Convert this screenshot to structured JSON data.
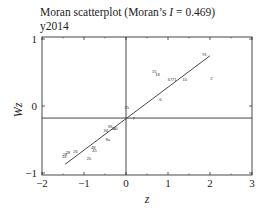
{
  "chart_data": {
    "type": "scatter",
    "title": "Moran scatterplot (Moran’s I = 0.469)",
    "title_parts": {
      "prefix": "Moran scatterplot (Moran’s ",
      "italic": "I",
      "suffix": " = 0.469)"
    },
    "subtitle": "y2014",
    "xlabel": "z",
    "ylabel": "Wz",
    "xlim": [
      -2,
      3
    ],
    "ylim": [
      -1,
      1
    ],
    "xticks": [
      "-2",
      "-1",
      "0",
      "1",
      "2",
      "3"
    ],
    "yticks": [
      "1",
      "0",
      "-1"
    ],
    "grid": false,
    "legend": null,
    "reference_lines": {
      "vertical_x": 0.0,
      "horizontal_y": -0.18
    },
    "regression_line": {
      "slope": 0.469,
      "from": [
        -1.45,
        -0.87
      ],
      "to": [
        2.0,
        0.75
      ]
    },
    "points": [
      {
        "label": "91",
        "x": 1.87,
        "y": 0.77
      },
      {
        "label": "15",
        "x": 0.67,
        "y": 0.52
      },
      {
        "label": "18",
        "x": 0.75,
        "y": 0.47
      },
      {
        "label": "2",
        "x": 2.03,
        "y": 0.41
      },
      {
        "label": "67",
        "x": 1.05,
        "y": 0.39
      },
      {
        "label": "71",
        "x": 1.15,
        "y": 0.4
      },
      {
        "label": "10",
        "x": 1.4,
        "y": 0.4
      },
      {
        "label": "6",
        "x": 0.82,
        "y": 0.09
      },
      {
        "label": "55",
        "x": 0.02,
        "y": -0.02
      },
      {
        "label": "7",
        "x": 0.18,
        "y": -0.18
      },
      {
        "label": "39",
        "x": -0.38,
        "y": -0.31
      },
      {
        "label": "34",
        "x": -0.48,
        "y": -0.36
      },
      {
        "label": "30",
        "x": -0.3,
        "y": -0.34
      },
      {
        "label": "40",
        "x": -0.25,
        "y": -0.33
      },
      {
        "label": "8a",
        "x": -0.43,
        "y": -0.5
      },
      {
        "label": "48",
        "x": -0.78,
        "y": -0.62
      },
      {
        "label": "45",
        "x": -0.75,
        "y": -0.66
      },
      {
        "label": "26",
        "x": -1.2,
        "y": -0.68
      },
      {
        "label": "28",
        "x": -1.38,
        "y": -0.7
      },
      {
        "label": "29",
        "x": -1.45,
        "y": -0.73
      },
      {
        "label": "24",
        "x": -1.47,
        "y": -0.76
      },
      {
        "label": "20",
        "x": -0.88,
        "y": -0.78
      }
    ]
  }
}
